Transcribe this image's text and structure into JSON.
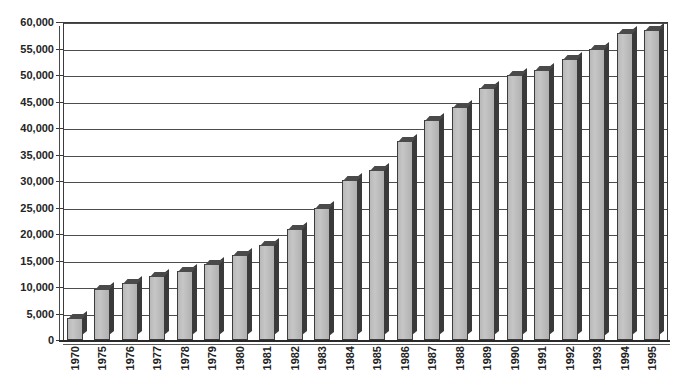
{
  "chart_data": {
    "type": "bar",
    "title": "",
    "subtitle": "",
    "xlabel": "",
    "ylabel": "",
    "categories": [
      "1970",
      "1975",
      "1976",
      "1977",
      "1978",
      "1979",
      "1980",
      "1981",
      "1982",
      "1983",
      "1984",
      "1985",
      "1986",
      "1987",
      "1988",
      "1989",
      "1990",
      "1991",
      "1992",
      "1993",
      "1994",
      "1995"
    ],
    "values": [
      4200,
      9700,
      10700,
      12000,
      13000,
      14300,
      16000,
      18000,
      21000,
      25000,
      30200,
      32000,
      37500,
      41500,
      44000,
      47500,
      50000,
      51000,
      53000,
      55000,
      58000,
      58500
    ],
    "series": [
      {
        "name": "",
        "values": [
          4200,
          9700,
          10700,
          12000,
          13000,
          14300,
          16000,
          18000,
          21000,
          25000,
          30200,
          32000,
          37500,
          41500,
          44000,
          47500,
          50000,
          51000,
          53000,
          55000,
          58000,
          58500
        ]
      }
    ],
    "ylim": [
      0,
      60000
    ],
    "ytick_values": [
      0,
      5000,
      10000,
      15000,
      20000,
      25000,
      30000,
      35000,
      40000,
      45000,
      50000,
      55000,
      60000
    ],
    "ytick_labels": [
      "0",
      "5,000",
      "10,000",
      "15,000",
      "20,000",
      "25,000",
      "30,000",
      "35,000",
      "40,000",
      "45,000",
      "50,000",
      "55,000",
      "60,000"
    ],
    "grid": true,
    "grid_axis": "y",
    "legend": false,
    "legend_position": "none",
    "bar_style": "3d-column",
    "annotations": []
  },
  "colors": {
    "bar_fill": "#c0c0c0",
    "bar_edge": "#3c3c3c",
    "bar_shadow": "#3a3a3a",
    "gridline": "#4d4d4d",
    "axis": "#2a2a2a",
    "text": "#222222",
    "background": "#ffffff"
  }
}
